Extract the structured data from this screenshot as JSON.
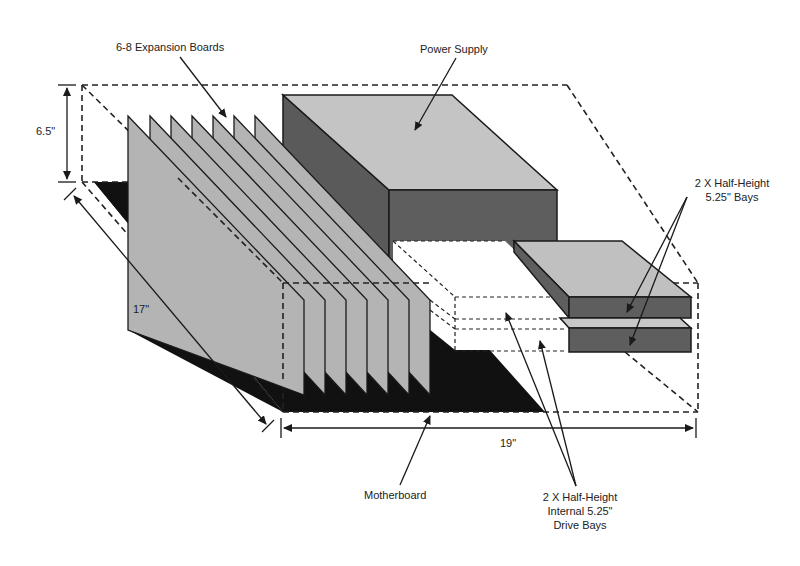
{
  "diagram": {
    "type": "isometric-chassis-layout",
    "colors": {
      "background": "#ffffff",
      "motherboard": "#111111",
      "board_face": "#b4b4b4",
      "board_edge": "#1a1a1a",
      "power_supply_top": "#c4c4c4",
      "power_supply_side": "#5a5a5a",
      "bay_top": "#c0c0c0",
      "bay_front": "#5e5e5e",
      "internal_bay": "#ffffff",
      "dashed_outline": "#222222"
    },
    "labels": {
      "expansion_boards": "6-8 Expansion Boards",
      "power_supply": "Power Supply",
      "external_bays_line1": "2 X Half-Height",
      "external_bays_line2": "5.25\" Bays",
      "internal_bays_line1": "2 X Half-Height",
      "internal_bays_line2": "Internal 5.25\"",
      "internal_bays_line3": "Drive Bays",
      "motherboard": "Motherboard"
    },
    "dimensions": {
      "height": "6.5\"",
      "depth": "17\"",
      "width": "19\""
    },
    "components": [
      {
        "name": "Expansion Boards",
        "count": "6-8",
        "drawn": 7
      },
      {
        "name": "Power Supply"
      },
      {
        "name": "External Half-Height 5.25\" Bays",
        "count": 2
      },
      {
        "name": "Internal Half-Height 5.25\" Drive Bays",
        "count": 2
      },
      {
        "name": "Motherboard"
      }
    ]
  }
}
